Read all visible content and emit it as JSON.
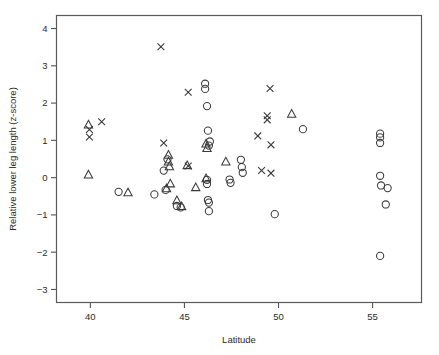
{
  "figure": {
    "width": 439,
    "height": 355,
    "background": "#ffffff",
    "ink_color": "#3a3a3a",
    "frame_color": "#5a5a5a"
  },
  "chart_data": {
    "type": "scatter",
    "title": "",
    "subtitle": "",
    "xlabel": "Latitude",
    "ylabel": "Relative lower leg length (z-score)",
    "xlim": [
      38.2,
      57.6
    ],
    "ylim": [
      -3.35,
      4.35
    ],
    "xticks": [
      40,
      45,
      50,
      55
    ],
    "xticklabels": [
      "40",
      "45",
      "50",
      "55"
    ],
    "yticks": [
      4,
      3,
      2,
      1,
      0,
      -1,
      -2,
      -3
    ],
    "yticklabels": [
      "4",
      "3",
      "2",
      "1",
      "0",
      "−1",
      "−2",
      "−3"
    ],
    "grid": false,
    "legend": null,
    "legend_position": "none",
    "marker_types": [
      "circle",
      "triangle",
      "cross"
    ],
    "series": [
      {
        "name": "circle",
        "marker": "circle",
        "points": [
          [
            41.5,
            -0.38
          ],
          [
            43.4,
            -0.45
          ],
          [
            43.9,
            0.19
          ],
          [
            44.0,
            -0.33
          ],
          [
            44.1,
            0.49
          ],
          [
            44.6,
            -0.76
          ],
          [
            44.8,
            -0.8
          ],
          [
            46.1,
            2.52
          ],
          [
            46.1,
            2.38
          ],
          [
            46.2,
            1.92
          ],
          [
            46.25,
            1.26
          ],
          [
            46.3,
            0.86
          ],
          [
            46.35,
            0.97
          ],
          [
            46.2,
            -0.06
          ],
          [
            46.2,
            -0.17
          ],
          [
            46.25,
            -0.6
          ],
          [
            46.3,
            -0.67
          ],
          [
            46.3,
            -0.9
          ],
          [
            47.4,
            -0.05
          ],
          [
            47.45,
            -0.14
          ],
          [
            48.0,
            0.48
          ],
          [
            48.05,
            0.28
          ],
          [
            48.1,
            0.13
          ],
          [
            49.8,
            -0.98
          ],
          [
            51.3,
            1.3
          ],
          [
            55.4,
            1.18
          ],
          [
            55.4,
            1.08
          ],
          [
            55.4,
            0.93
          ],
          [
            55.4,
            0.05
          ],
          [
            55.45,
            -0.21
          ],
          [
            55.8,
            -0.28
          ],
          [
            55.7,
            -0.72
          ],
          [
            55.4,
            -2.1
          ]
        ]
      },
      {
        "name": "triangle",
        "marker": "triangle",
        "points": [
          [
            39.9,
            1.41
          ],
          [
            39.9,
            0.07
          ],
          [
            42.0,
            -0.41
          ],
          [
            44.05,
            -0.3
          ],
          [
            44.15,
            0.6
          ],
          [
            44.15,
            0.42
          ],
          [
            44.2,
            0.29
          ],
          [
            44.25,
            -0.17
          ],
          [
            44.6,
            -0.62
          ],
          [
            44.85,
            -0.78
          ],
          [
            45.15,
            0.32
          ],
          [
            45.6,
            -0.27
          ],
          [
            46.15,
            0.9
          ],
          [
            46.2,
            0.78
          ],
          [
            46.15,
            -0.03
          ],
          [
            47.2,
            0.42
          ],
          [
            50.7,
            1.7
          ]
        ]
      },
      {
        "name": "cross",
        "marker": "cross",
        "points": [
          [
            39.95,
            1.29
          ],
          [
            39.95,
            1.09
          ],
          [
            40.6,
            1.5
          ],
          [
            43.75,
            3.51
          ],
          [
            43.9,
            0.93
          ],
          [
            45.2,
            2.29
          ],
          [
            45.2,
            0.31
          ],
          [
            48.9,
            1.12
          ],
          [
            49.4,
            1.66
          ],
          [
            49.4,
            1.55
          ],
          [
            49.55,
            2.39
          ],
          [
            49.6,
            0.88
          ],
          [
            49.1,
            0.19
          ],
          [
            49.6,
            0.12
          ]
        ]
      }
    ]
  }
}
